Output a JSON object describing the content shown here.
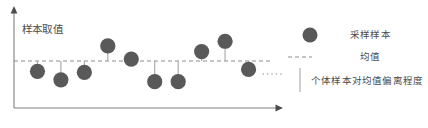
{
  "chart_data": {
    "type": "scatter",
    "title": "",
    "ylabel": "样本取值",
    "xlabel": "",
    "xlim": [
      0,
      11
    ],
    "ylim": [
      0,
      10
    ],
    "grid": false,
    "mean_value": 5.0,
    "mean_line_style": "dashed",
    "stem_note": "each point connected to the mean line by a vertical segment",
    "x": [
      1,
      2,
      3,
      4,
      5,
      6,
      7,
      8,
      9,
      10
    ],
    "values": [
      3.9,
      3.0,
      3.8,
      6.6,
      5.2,
      2.8,
      2.8,
      6.0,
      7.1,
      4.1
    ],
    "point_color": "#595959",
    "mean_line_color": "#8c8c8c",
    "stem_color": "#a6a6a6",
    "axis_color": "#808080",
    "continuation_marker": "……",
    "legend": {
      "position": "right",
      "entries": [
        {
          "marker": "circle",
          "label": "采样样本"
        },
        {
          "marker": "dashed-line",
          "label": "均值"
        },
        {
          "marker": "vertical-line",
          "label": "个体样本对均值偏离程度"
        }
      ]
    }
  },
  "axes": {
    "y_label": "样本取值"
  },
  "legend": {
    "sample_label": "采样样本",
    "mean_label": "均值",
    "deviation_label": "个体样本对均值偏离程度"
  },
  "colors": {
    "point": "#595959",
    "mean_line": "#8c8c8c",
    "stem": "#a6a6a6",
    "axis": "#808080",
    "text": "#4a4a4a"
  }
}
